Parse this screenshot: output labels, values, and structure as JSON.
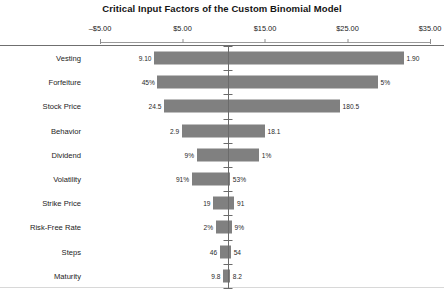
{
  "chart_data": {
    "type": "bar",
    "subtype": "tornado",
    "title": "Critical Input Factors of the Custom Binomial Model",
    "xlabel": "",
    "ylabel": "",
    "orientation": "horizontal",
    "grid": false,
    "legend": null,
    "axis_position": "top",
    "xlim": [
      -5.0,
      35.0
    ],
    "base_value": 10.5,
    "tick_values": [
      -5.0,
      5.0,
      15.0,
      25.0,
      35.0
    ],
    "tick_labels": [
      "–$5.00",
      "$5.00",
      "$15.00",
      "$25.00",
      "$35.00"
    ],
    "categories": [
      "Vesting",
      "Forfeiture",
      "Stock Price",
      "Behavior",
      "Dividend",
      "Volatility",
      "Strike Price",
      "Risk-Free Rate",
      "Steps",
      "Maturity"
    ],
    "rows": [
      {
        "category": "Vesting",
        "left_label": "9.10",
        "right_label": "1.90",
        "low_x": 1.55,
        "high_x": 31.85
      },
      {
        "category": "Forfeiture",
        "left_label": "45%",
        "right_label": "5%",
        "low_x": 1.95,
        "high_x": 28.7
      },
      {
        "category": "Stock Price",
        "left_label": "24.5",
        "right_label": "180.5",
        "low_x": 2.75,
        "high_x": 24.1
      },
      {
        "category": "Behavior",
        "left_label": "2.9",
        "right_label": "18.1",
        "low_x": 4.9,
        "high_x": 15.0
      },
      {
        "category": "Dividend",
        "left_label": "9%",
        "right_label": "1%",
        "low_x": 6.7,
        "high_x": 14.3
      },
      {
        "category": "Volatility",
        "left_label": "91%",
        "right_label": "53%",
        "low_x": 6.1,
        "high_x": 10.8
      },
      {
        "category": "Strike Price",
        "left_label": "19",
        "right_label": "91",
        "low_x": 8.7,
        "high_x": 11.3
      },
      {
        "category": "Risk-Free Rate",
        "left_label": "2%",
        "right_label": "9%",
        "low_x": 9.0,
        "high_x": 11.0
      },
      {
        "category": "Steps",
        "left_label": "46",
        "right_label": "54",
        "low_x": 9.5,
        "high_x": 10.9
      },
      {
        "category": "Maturity",
        "left_label": "9.8",
        "right_label": "8.2",
        "low_x": 9.9,
        "high_x": 10.8
      }
    ],
    "colors": {
      "bar": "#808080",
      "axis": "#8d8d8d",
      "spine": "#6b6b6b",
      "frame_top": "#6f6f6f",
      "text": "#1c1c1c",
      "background": "#ffffff"
    }
  }
}
